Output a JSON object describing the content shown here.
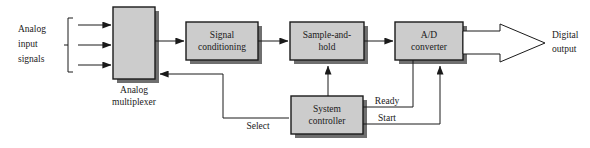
{
  "diagram": {
    "colors": {
      "box_fill": "#cccccc",
      "box_stroke": "#1a1a1a",
      "shadow": "#6f6f6f",
      "background": "#ffffff",
      "arrow_fill": "#ffffff"
    },
    "blocks": [
      {
        "id": "analog-multiplexer",
        "line1": "",
        "line2": "",
        "caption_line1": "Analog",
        "caption_line2": "multiplexer"
      },
      {
        "id": "signal-conditioning",
        "line1": "Signal",
        "line2": "conditioning"
      },
      {
        "id": "sample-and-hold",
        "line1": "Sample-and-",
        "line2": "hold"
      },
      {
        "id": "ad-converter",
        "line1": "A/D",
        "line2": "converter"
      },
      {
        "id": "system-controller",
        "line1": "System",
        "line2": "controller"
      }
    ],
    "labels": {
      "analog_input_line1": "Analog",
      "analog_input_line2": "input",
      "analog_input_line3": "signals",
      "mux_caption_line1": "Analog",
      "mux_caption_line2": "multiplexer",
      "signal_conditioning_line1": "Signal",
      "signal_conditioning_line2": "conditioning",
      "sample_hold_line1": "Sample-and-",
      "sample_hold_line2": "hold",
      "ad_converter_line1": "A/D",
      "ad_converter_line2": "converter",
      "system_controller_line1": "System",
      "system_controller_line2": "controller",
      "select": "Select",
      "ready": "Ready",
      "start": "Start",
      "digital_output_line1": "Digital",
      "digital_output_line2": "output"
    },
    "signals": [
      {
        "name": "select",
        "label": "Select",
        "from": "system-controller",
        "to": "analog-multiplexer"
      },
      {
        "name": "ready",
        "label": "Ready",
        "from": "ad-converter",
        "to": "system-controller"
      },
      {
        "name": "start",
        "label": "Start",
        "from": "system-controller",
        "to": "ad-converter"
      },
      {
        "name": "sample-trigger",
        "label": "",
        "from": "system-controller",
        "to": "sample-and-hold"
      }
    ],
    "input_count": 3
  }
}
